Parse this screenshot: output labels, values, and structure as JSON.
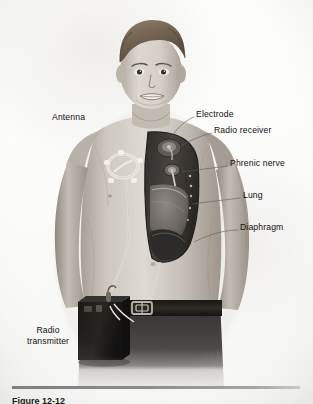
{
  "figure": {
    "style": "grayscale-halftone-medical-illustration",
    "background_color": "#fdfdfc",
    "ink_color": "#10100f"
  },
  "labels": [
    {
      "id": "antenna",
      "text": "Antenna",
      "x": 52,
      "y": 118,
      "anchor": "left",
      "leader": false
    },
    {
      "id": "electrode",
      "text": "Electrode",
      "x": 196,
      "y": 114,
      "anchor": "left",
      "leader": true
    },
    {
      "id": "radio-receiver",
      "text": "Radio receiver",
      "x": 214,
      "y": 130,
      "anchor": "left",
      "leader": true
    },
    {
      "id": "phrenic-nerve",
      "text": "Phrenic nerve",
      "x": 230,
      "y": 163,
      "anchor": "left",
      "leader": true
    },
    {
      "id": "lung",
      "text": "Lung",
      "x": 243,
      "y": 195,
      "anchor": "left",
      "leader": true
    },
    {
      "id": "diaphragm",
      "text": "Diaphragm",
      "x": 240,
      "y": 227,
      "anchor": "left",
      "leader": true
    }
  ],
  "multiline_labels": [
    {
      "id": "radio-transmitter",
      "line1": "Radio",
      "line2": "transmitter",
      "x": 18,
      "y": 330
    }
  ],
  "signature": {
    "text": "illustrator",
    "x": 213,
    "y": 341
  },
  "caption": {
    "text": "Figure 12-12"
  },
  "anatomy": {
    "cutaway_window": "right chest opened to show thoracic contents",
    "parts": [
      "radio receiver implanted beneath skin",
      "electrode on phrenic nerve",
      "phrenic nerve descending in thorax",
      "lung",
      "diaphragm"
    ],
    "external_parts": [
      "antenna coil taped over receiver on chest",
      "lead wire running down the abdomen",
      "radio transmitter box worn on belt"
    ]
  },
  "colors": {
    "skin_light": "#d9d4cd",
    "skin_mid": "#b6afa7",
    "skin_shadow": "#8e877f",
    "hair": "#7a6a58",
    "cavity_dark": "#3c3a38",
    "lung": "#6f6a66",
    "diaphragm": "#2f2d2c",
    "trousers": "#3a3937",
    "belt": "#23221f",
    "transmitter": "#1d1c1a",
    "rule": "#8b8b8b"
  }
}
